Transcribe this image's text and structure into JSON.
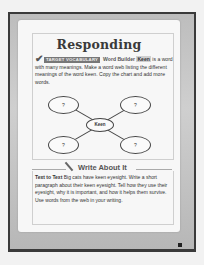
{
  "page": {
    "title": "Responding",
    "vocab": {
      "badge": "TARGET VOCABULARY",
      "heading": "Word Builder",
      "keyword": "Keen",
      "text_after": "is a word with many meanings. Make a word web listing the different meanings of the word keen. Copy the chart and add more words."
    },
    "web": {
      "center": "Keen",
      "nodes": [
        "?",
        "?",
        "?",
        "?"
      ]
    },
    "write_about_it": {
      "heading": "Write About It",
      "lead": "Text to Text",
      "text": "Big cats have keen eyesight. Write a short paragraph about their keen eyesight. Tell how they use their eyesight, why it is important, and how it helps them survive. Use words from the web in your writing."
    }
  }
}
